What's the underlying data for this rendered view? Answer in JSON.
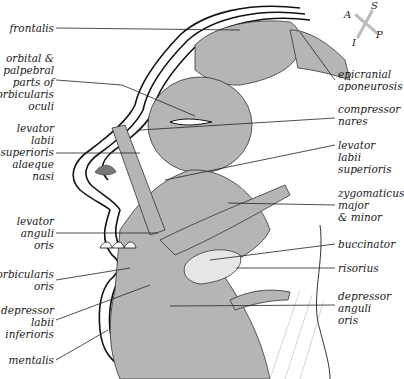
{
  "diagram": {
    "colors": {
      "muscle_fill": "#b5b5b5",
      "muscle_fill_dark": "#9e9e9e",
      "outline": "#111111",
      "leader_line": "#222222",
      "background": "#ffffff",
      "compass": "#bdbdbd"
    },
    "compass": {
      "S": "S",
      "A": "A",
      "P": "P",
      "I": "I"
    },
    "labels_left": [
      {
        "id": "frontalis",
        "text": "frontalis"
      },
      {
        "id": "orbicularis-oculi",
        "text": "orbital &\npalpebral\nparts of\norbicularis\noculi"
      },
      {
        "id": "levator-labii-superioris-alaeque-nasi",
        "text": "levator\nlabii\nsuperioris\nalaeque\nnasi"
      },
      {
        "id": "levator-anguli-oris",
        "text": "levator\nanguli\noris"
      },
      {
        "id": "orbicularis-oris",
        "text": "orbicularis\noris"
      },
      {
        "id": "depressor-labii-inferioris",
        "text": "depressor\nlabii\ninferioris"
      },
      {
        "id": "mentalis",
        "text": "mentalis"
      }
    ],
    "labels_right": [
      {
        "id": "epicranial-aponeurosis",
        "text": "epicranial\naponeurosis"
      },
      {
        "id": "compressor-nares",
        "text": "compressor\nnares"
      },
      {
        "id": "levator-labii-superioris",
        "text": "levator\nlabii\nsuperioris"
      },
      {
        "id": "zygomaticus",
        "text": "zygomaticus\nmajor\n& minor"
      },
      {
        "id": "buccinator",
        "text": "buccinator"
      },
      {
        "id": "risorius",
        "text": "risorius"
      },
      {
        "id": "depressor-anguli-oris",
        "text": "depressor\nanguli\noris"
      }
    ]
  }
}
